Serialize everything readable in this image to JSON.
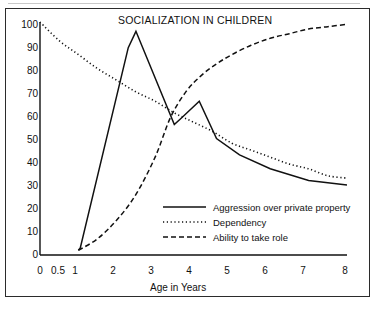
{
  "figure": {
    "title": "SOCIALIZATION IN CHILDREN",
    "xlabel": "Age in Years",
    "background_color": "#ffffff",
    "line_color": "#111111",
    "border_color": "#2b2b2b"
  },
  "axes": {
    "y_ticks": [
      "0",
      "10",
      "20",
      "30",
      "40",
      "50",
      "60",
      "70",
      "80",
      "90",
      "100"
    ],
    "x_ticks": [
      "0",
      "0.5",
      "1",
      "2",
      "3",
      "4",
      "5",
      "6",
      "7",
      "8"
    ]
  },
  "legend": {
    "entries": [
      {
        "label": "Aggression over private property",
        "style": "solid"
      },
      {
        "label": "Dependency",
        "style": "dotted"
      },
      {
        "label": "Ability to take role",
        "style": "dashed"
      }
    ]
  },
  "chart_data": {
    "type": "line",
    "title": "SOCIALIZATION IN CHILDREN",
    "xlabel": "Age in Years",
    "ylabel": "",
    "xlim": [
      0,
      8
    ],
    "ylim": [
      0,
      100
    ],
    "grid": false,
    "legend_position": "inside-lower-right",
    "x_tick_values": [
      0,
      0.5,
      1,
      2,
      3,
      4,
      5,
      6,
      7,
      8
    ],
    "y_tick_values": [
      0,
      10,
      20,
      30,
      40,
      50,
      60,
      70,
      80,
      90,
      100
    ],
    "series": [
      {
        "name": "Aggression over private property",
        "style": "solid",
        "points": [
          [
            1.0,
            2
          ],
          [
            1.05,
            3
          ],
          [
            2.3,
            89
          ],
          [
            2.5,
            96
          ],
          [
            3.5,
            56
          ],
          [
            3.7,
            59
          ],
          [
            4.15,
            66
          ],
          [
            4.6,
            50
          ],
          [
            5.2,
            43
          ],
          [
            6.0,
            37
          ],
          [
            7.0,
            32
          ],
          [
            8.0,
            30
          ]
        ]
      },
      {
        "name": "Dependency",
        "style": "dotted",
        "points": [
          [
            0.0,
            100
          ],
          [
            0.5,
            92
          ],
          [
            1.0,
            86
          ],
          [
            1.5,
            80
          ],
          [
            2.0,
            75
          ],
          [
            2.5,
            70
          ],
          [
            3.0,
            66
          ],
          [
            3.5,
            61
          ],
          [
            4.0,
            57
          ],
          [
            4.5,
            53
          ],
          [
            5.0,
            48
          ],
          [
            5.5,
            45
          ],
          [
            6.0,
            42
          ],
          [
            6.5,
            39
          ],
          [
            7.0,
            37
          ],
          [
            7.5,
            34
          ],
          [
            8.0,
            33
          ]
        ]
      },
      {
        "name": "Ability to take role",
        "style": "dashed",
        "points": [
          [
            1.0,
            2
          ],
          [
            1.5,
            7
          ],
          [
            2.0,
            15
          ],
          [
            2.5,
            26
          ],
          [
            3.0,
            42
          ],
          [
            3.4,
            59
          ],
          [
            3.8,
            70
          ],
          [
            4.2,
            77
          ],
          [
            4.6,
            82
          ],
          [
            5.0,
            86
          ],
          [
            5.5,
            90
          ],
          [
            6.0,
            93
          ],
          [
            6.5,
            95
          ],
          [
            7.0,
            97
          ],
          [
            7.5,
            98
          ],
          [
            8.0,
            99
          ]
        ]
      }
    ]
  }
}
